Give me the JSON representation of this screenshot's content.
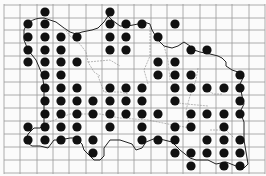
{
  "map": {
    "type": "distribution-grid-map",
    "region": "island outline with parish boundaries",
    "colors": {
      "background": "#fbfbfb",
      "grid": "#9a9a9a",
      "coastline": "#222222",
      "boundaries": "#888888",
      "dot": "#111111"
    },
    "grid": {
      "x_lines": [
        4,
        20,
        37,
        53,
        69,
        86,
        102,
        118,
        134,
        151,
        167,
        183,
        200,
        216,
        232,
        249,
        265
      ],
      "y_lines": [
        5,
        18,
        30,
        43,
        56,
        69,
        82,
        95,
        108,
        121,
        134,
        147,
        160,
        173
      ]
    },
    "dot_columns_x": [
      28,
      45,
      61,
      77,
      93,
      110,
      126,
      142,
      158,
      175,
      191,
      207,
      224,
      240
    ],
    "dot_rows_y": [
      12,
      24,
      37,
      50,
      62,
      75,
      88,
      101,
      114,
      127,
      140,
      153,
      166
    ],
    "dot_radius": 4.6,
    "occupied_cells": [
      [
        1,
        5
      ],
      [
        0,
        1,
        5,
        6,
        7,
        9
      ],
      [
        0,
        1,
        2,
        3,
        5,
        6,
        8
      ],
      [
        0,
        1,
        2,
        5,
        6,
        10,
        11
      ],
      [
        0,
        1,
        2,
        3,
        8,
        9
      ],
      [
        1,
        2,
        8,
        9,
        10,
        13
      ],
      [
        1,
        2,
        3,
        5,
        6,
        7,
        9,
        10,
        11,
        12,
        13
      ],
      [
        1,
        2,
        3,
        4,
        5,
        6,
        7,
        9,
        13
      ],
      [
        1,
        2,
        3,
        4,
        5,
        6,
        7,
        8,
        10,
        11,
        12,
        13
      ],
      [
        0,
        1,
        2,
        3,
        5,
        7,
        9,
        10,
        12
      ],
      [
        0,
        1,
        2,
        3,
        4,
        7,
        8,
        9,
        11,
        12,
        13
      ],
      [
        4,
        9,
        10,
        11,
        12,
        13
      ],
      [
        10,
        12,
        13
      ]
    ]
  }
}
